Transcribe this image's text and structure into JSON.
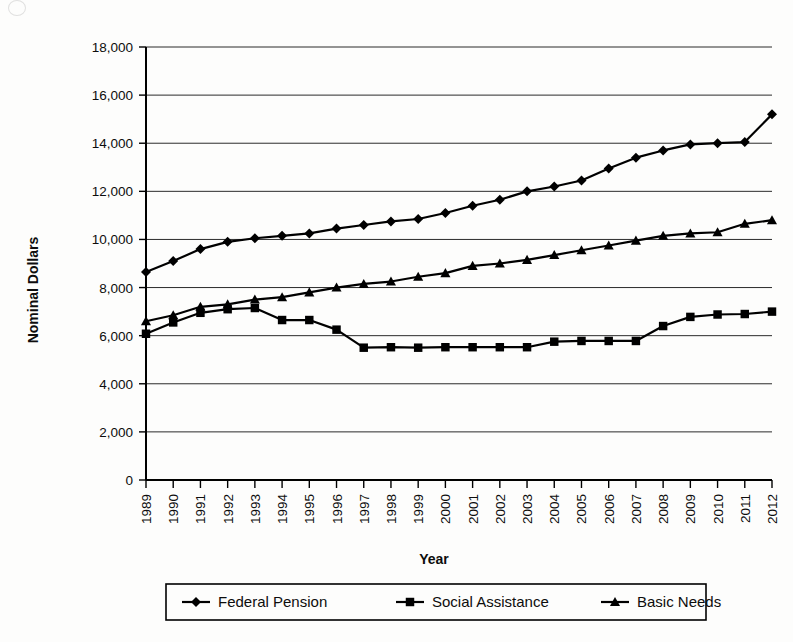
{
  "figure": {
    "name": "line-chart-nominal-dollars-by-year"
  },
  "axes": {
    "y_title": "Nominal Dollars",
    "x_title": "Year"
  },
  "legend": {
    "items": [
      {
        "label": "Federal Pension",
        "marker": "diamond"
      },
      {
        "label": "Social Assistance",
        "marker": "square"
      },
      {
        "label": "Basic Needs",
        "marker": "triangle"
      }
    ]
  },
  "chart_data": {
    "type": "line",
    "title": "",
    "xlabel": "Year",
    "ylabel": "Nominal Dollars",
    "ylim": [
      0,
      18000
    ],
    "ytick_step": 2000,
    "ytick_labels": [
      "0",
      "2,000",
      "4,000",
      "6,000",
      "8,000",
      "10,000",
      "12,000",
      "14,000",
      "16,000",
      "18,000"
    ],
    "grid": true,
    "legend_position": "bottom",
    "categories": [
      "1989",
      "1990",
      "1991",
      "1992",
      "1993",
      "1994",
      "1995",
      "1996",
      "1997",
      "1998",
      "1999",
      "2000",
      "2001",
      "2002",
      "2003",
      "2004",
      "2005",
      "2006",
      "2007",
      "2008",
      "2009",
      "2010",
      "2011",
      "2012"
    ],
    "series": [
      {
        "name": "Federal Pension",
        "marker": "diamond",
        "values": [
          8650,
          9100,
          9600,
          9900,
          10050,
          10150,
          10250,
          10450,
          10600,
          10750,
          10850,
          11100,
          11400,
          11650,
          12000,
          12200,
          12450,
          12950,
          13400,
          13700,
          13950,
          14000,
          14050,
          15200
        ]
      },
      {
        "name": "Social Assistance",
        "marker": "square",
        "values": [
          6080,
          6550,
          6950,
          7100,
          7150,
          6650,
          6650,
          6250,
          5500,
          5520,
          5500,
          5520,
          5520,
          5520,
          5520,
          5750,
          5780,
          5780,
          5780,
          6400,
          6780,
          6880,
          6900,
          7000
        ]
      },
      {
        "name": "Basic Needs",
        "marker": "triangle",
        "values": [
          6600,
          6850,
          7200,
          7300,
          7500,
          7600,
          7800,
          8000,
          8150,
          8250,
          8450,
          8600,
          8900,
          9000,
          9150,
          9350,
          9550,
          9750,
          9950,
          10150,
          10250,
          10300,
          10650,
          10800
        ]
      }
    ]
  },
  "colors": {
    "ink": "#000000",
    "grid": "#2b2b2b",
    "paper": "#fdfdfc"
  }
}
